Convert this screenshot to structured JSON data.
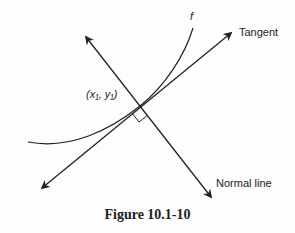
{
  "diagram": {
    "curve_label": "f",
    "tangent_label": "Tangent",
    "normal_label": "Normal line",
    "point_label": "(x₁, y₁)",
    "caption": "Figure 10.1-10"
  }
}
